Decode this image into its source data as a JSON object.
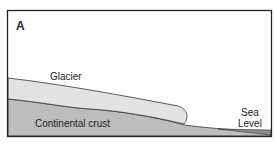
{
  "figure": {
    "panel_label": "A",
    "labels": {
      "glacier": "Glacier",
      "crust": "Continental crust",
      "sea_line1": "Sea",
      "sea_line2": "Level"
    },
    "colors": {
      "frame": "#222222",
      "glacier_fill": "#e2e2e2",
      "crust_fill": "#bdbdbd",
      "sea_fill": "#8a8a8a",
      "outline": "#333333"
    }
  }
}
